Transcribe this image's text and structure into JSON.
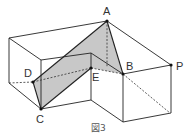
{
  "figure": {
    "caption": "図3",
    "shade_color": "#c8c8c8",
    "line_color": "#222222",
    "points": {
      "A": {
        "label": "A",
        "x": 107,
        "y": 21
      },
      "B": {
        "label": "B",
        "x": 123,
        "y": 74
      },
      "C": {
        "label": "C",
        "x": 41,
        "y": 109
      },
      "D": {
        "label": "D",
        "x": 33,
        "y": 82
      },
      "E": {
        "label": "E",
        "x": 91,
        "y": 68
      },
      "P": {
        "label": "P",
        "x": 171,
        "y": 65
      }
    },
    "section_polygon": [
      "D",
      "A",
      "B",
      "E",
      "C"
    ]
  }
}
